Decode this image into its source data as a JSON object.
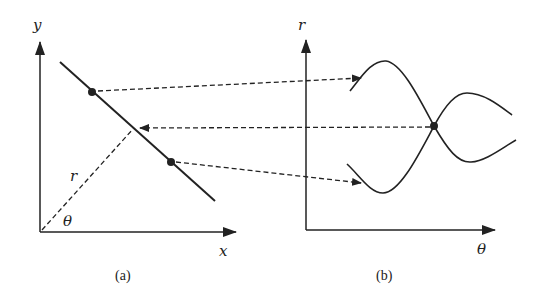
{
  "panel_a": {
    "caption": "(a)",
    "x_axis_label": "x",
    "y_axis_label": "y",
    "distance_label": "r",
    "angle_label": "θ"
  },
  "panel_b": {
    "caption": "(b)",
    "x_axis_label": "θ",
    "y_axis_label": "r"
  },
  "colors": {
    "stroke": "#222222",
    "background": "#ffffff"
  }
}
